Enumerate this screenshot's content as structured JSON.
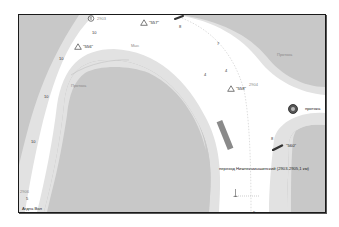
{
  "map": {
    "colors": {
      "land": "#c8c8c8",
      "shallow": "#e2e2e2",
      "channel": "#ffffff",
      "border": "#1a1a1a",
      "buoy": "#3a3a3a"
    },
    "km_markers": [
      {
        "id": "km-2903",
        "label": "2903"
      },
      {
        "id": "km-2904",
        "label": "2904"
      },
      {
        "id": "km-2906",
        "label": "2906"
      }
    ],
    "buoys": [
      {
        "id": "buoy-556",
        "label": "\"556\""
      },
      {
        "id": "buoy-557",
        "label": "\"557\""
      },
      {
        "id": "buoy-558",
        "label": "\"558\""
      },
      {
        "id": "buoy-560",
        "label": "\"560\""
      }
    ],
    "place_labels": {
      "protoka_left": "Протока",
      "protoka_right": "Протока",
      "protoka_edge": "протока",
      "mys": "Мыс",
      "crossing": "переход Нижнекамышинский (2903-2905,1 км)",
      "bottom_left": "Агдна Вол"
    },
    "depths": [
      "10",
      "10",
      "10",
      "10",
      "7",
      "4",
      "4",
      "8",
      "8",
      "5",
      "9"
    ]
  }
}
